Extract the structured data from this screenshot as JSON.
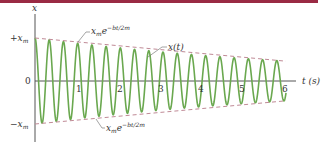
{
  "colors": {
    "top_bar": "#9a2a44",
    "curve": "#6aa84f",
    "envelope": "#c08a96",
    "axis": "#555555",
    "text": "#333333"
  },
  "chart_data": {
    "type": "line",
    "title": "",
    "xlabel": "t (s)",
    "ylabel": "x",
    "x_ticks": [
      "1",
      "2",
      "3",
      "4",
      "5",
      "6"
    ],
    "y_ticks": [
      "+x_m",
      "0",
      "-x_m"
    ],
    "xlim": [
      0,
      6
    ],
    "ylim": [
      -1,
      1
    ],
    "grid": false,
    "legend": null,
    "annotations": [
      {
        "text": "x_m e^{-bt/2m}",
        "target": "upper envelope"
      },
      {
        "text": "x(t)",
        "target": "oscillating curve"
      },
      {
        "text": "x_m e^{-bt/2m}",
        "target": "lower envelope"
      }
    ],
    "series": [
      {
        "name": "x(t)",
        "description": "damped oscillation x_m e^{-bt/2m} cos(wt)",
        "amplitude_start": 1.0,
        "amplitude_end": 0.46,
        "period_s": 0.34
      },
      {
        "name": "upper envelope",
        "style": "dashed",
        "x": [
          0,
          6
        ],
        "y": [
          1.0,
          0.46
        ]
      },
      {
        "name": "lower envelope",
        "style": "dashed",
        "x": [
          0,
          6
        ],
        "y": [
          -1.0,
          -0.46
        ]
      }
    ]
  },
  "labels": {
    "y_axis": "x",
    "x_axis": "t (s)",
    "plus_xm": "+x",
    "minus_xm": "−x",
    "sub_m": "m",
    "zero": "0",
    "envelope_upper_base": "x",
    "envelope_upper_sub": "m",
    "envelope_upper_e": "e",
    "envelope_upper_exp": "−bt/2m",
    "envelope_lower_base": "x",
    "envelope_lower_sub": "m",
    "envelope_lower_e": "e",
    "envelope_lower_exp": "−bt/2m",
    "curve_label": "x(t)",
    "tick_1": "1",
    "tick_2": "2",
    "tick_3": "3",
    "tick_4": "4",
    "tick_5": "5",
    "tick_6": "6"
  }
}
